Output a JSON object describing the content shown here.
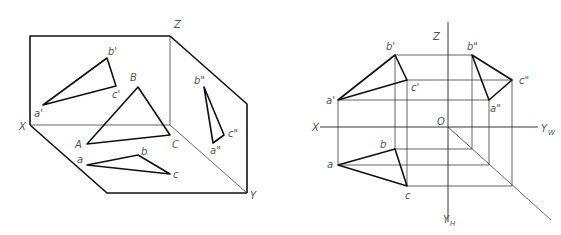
{
  "left_figure": {
    "title": "Pictorial view of triangle ABC in three projection planes",
    "axis_labels": {
      "x": "X",
      "y": "Y",
      "z": "Z"
    },
    "space_points": {
      "A": "A",
      "B": "B",
      "C": "C"
    },
    "front_view": {
      "a": "a'",
      "b": "b'",
      "c": "c'"
    },
    "top_view": {
      "a": "a",
      "b": "b",
      "c": "c"
    },
    "side_view": {
      "a": "a\"",
      "b": "b\"",
      "c": "c\""
    }
  },
  "right_figure": {
    "title": "Orthographic projection of triangle on unfolded planes",
    "axis_labels": {
      "x": "X",
      "z": "Z",
      "origin": "O",
      "yw": "Y",
      "yw_sub": "W",
      "yh": "Y",
      "yh_sub": "H"
    },
    "front_view": {
      "a": "a'",
      "b": "b'",
      "c": "c'"
    },
    "top_view": {
      "a": "a",
      "b": "b",
      "c": "c"
    },
    "side_view": {
      "a": "a\"",
      "b": "b\"",
      "c": "c\""
    }
  },
  "colors": {
    "line": "#111111",
    "label": "#555555",
    "background": "#ffffff"
  }
}
